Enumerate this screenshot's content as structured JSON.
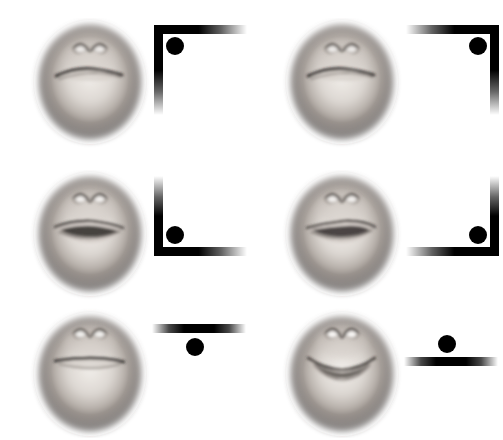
{
  "figure": {
    "background_color": "#ffffff",
    "width": 503,
    "height": 440,
    "rows": 3,
    "columns": 2,
    "ink_color": "#000000",
    "skin_light": "#e8e4e0",
    "skin_mid": "#b9b2ac",
    "skin_dark": "#4a4542"
  },
  "panels": [
    {
      "id": "panel-1",
      "position": "top-left",
      "row": 0,
      "column": 0,
      "face": {
        "name": "lower-face-smile-slanted",
        "expression_label": "closed slanted smile",
        "mouth_type": "closed-slanted-smile",
        "mouth_curve": "up-right",
        "mouth_open": false,
        "nose_visible": true,
        "vignette": true
      },
      "cue": {
        "name": "corner-bracket-top-left",
        "shape": "corner-bracket",
        "corner": "top-left",
        "dot_position": "inside-corner",
        "dot_label": "black-dot",
        "horizontal_arm": "extends-right-fading",
        "vertical_arm": "extends-down-fading"
      }
    },
    {
      "id": "panel-2",
      "position": "top-right",
      "row": 0,
      "column": 1,
      "face": {
        "name": "lower-face-smile-slanted-mirror",
        "expression_label": "closed slanted smile",
        "mouth_type": "closed-slanted-smile",
        "mouth_curve": "up-right",
        "mouth_open": false,
        "nose_visible": true,
        "vignette": true
      },
      "cue": {
        "name": "corner-bracket-top-right",
        "shape": "corner-bracket",
        "corner": "top-right",
        "dot_position": "inside-corner",
        "dot_label": "black-dot",
        "horizontal_arm": "extends-left-fading",
        "vertical_arm": "extends-down-fading"
      }
    },
    {
      "id": "panel-3",
      "position": "middle-left",
      "row": 1,
      "column": 0,
      "face": {
        "name": "lower-face-open-mouth",
        "expression_label": "slightly open mouth",
        "mouth_type": "open-lips-gap",
        "mouth_curve": "slanted",
        "mouth_open": true,
        "nose_visible": true,
        "vignette": true
      },
      "cue": {
        "name": "corner-bracket-bottom-left",
        "shape": "corner-bracket",
        "corner": "bottom-left",
        "dot_position": "inside-corner",
        "dot_label": "black-dot",
        "horizontal_arm": "extends-right-fading",
        "vertical_arm": "extends-up-fading"
      }
    },
    {
      "id": "panel-4",
      "position": "middle-right",
      "row": 1,
      "column": 1,
      "face": {
        "name": "lower-face-open-mouth-mirror",
        "expression_label": "slightly open mouth",
        "mouth_type": "open-lips-gap",
        "mouth_curve": "slanted",
        "mouth_open": true,
        "nose_visible": true,
        "vignette": true
      },
      "cue": {
        "name": "corner-bracket-bottom-right",
        "shape": "corner-bracket",
        "corner": "bottom-right",
        "dot_position": "inside-corner",
        "dot_label": "black-dot",
        "horizontal_arm": "extends-left-fading",
        "vertical_arm": "extends-up-fading"
      }
    },
    {
      "id": "panel-5",
      "position": "bottom-left",
      "row": 2,
      "column": 0,
      "face": {
        "name": "lower-face-neutral-smile",
        "expression_label": "neutral closed smile",
        "mouth_type": "closed-level-smile",
        "mouth_curve": "level",
        "mouth_open": false,
        "nose_visible": true,
        "vignette": true
      },
      "cue": {
        "name": "horizontal-line-dot-below",
        "shape": "horizontal-line",
        "corner": "none",
        "dot_position": "below-line",
        "dot_label": "black-dot",
        "horizontal_arm": "fades-both-ends",
        "vertical_arm": "none"
      }
    },
    {
      "id": "panel-6",
      "position": "bottom-right",
      "row": 2,
      "column": 1,
      "face": {
        "name": "lower-face-frown",
        "expression_label": "downturned frown",
        "mouth_type": "open-frown",
        "mouth_curve": "down",
        "mouth_open": true,
        "nose_visible": true,
        "vignette": true
      },
      "cue": {
        "name": "horizontal-line-dot-above",
        "shape": "horizontal-line",
        "corner": "none",
        "dot_position": "above-line",
        "dot_label": "black-dot",
        "horizontal_arm": "fades-both-ends",
        "vertical_arm": "none"
      }
    }
  ]
}
